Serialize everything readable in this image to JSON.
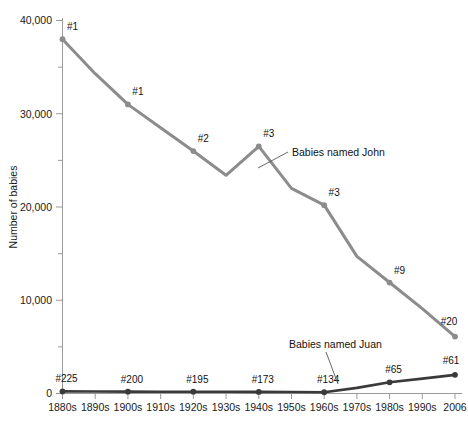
{
  "chart_data": {
    "type": "line",
    "title": "",
    "xlabel": "",
    "ylabel": "Number of babies",
    "ylim": [
      0,
      40000
    ],
    "ytick_labels": [
      "0",
      "10,000",
      "20,000",
      "30,000",
      "40,000"
    ],
    "ytick_values": [
      0,
      10000,
      20000,
      30000,
      40000
    ],
    "yminor_values": [
      5000,
      15000,
      25000,
      35000
    ],
    "grid": false,
    "legend_position": "inline-annotation",
    "categories": [
      "1880s",
      "1890s",
      "1900s",
      "1910s",
      "1920s",
      "1930s",
      "1940s",
      "1950s",
      "1960s",
      "1970s",
      "1980s",
      "1990s",
      "2006"
    ],
    "series": [
      {
        "name": "Babies named John",
        "color": "#8c8c8c",
        "values": [
          38000,
          34300,
          31000,
          28500,
          26000,
          23400,
          26500,
          22000,
          20200,
          14700,
          11900,
          9100,
          6100
        ],
        "point_labels": [
          {
            "category": "1880s",
            "text": "#1"
          },
          {
            "category": "1900s",
            "text": "#1"
          },
          {
            "category": "1920s",
            "text": "#2"
          },
          {
            "category": "1940s",
            "text": "#3"
          },
          {
            "category": "1960s",
            "text": "#3"
          },
          {
            "category": "1980s",
            "text": "#9"
          },
          {
            "category": "2006",
            "text": "#20"
          }
        ],
        "marker_categories": [
          "1880s",
          "1900s",
          "1920s",
          "1940s",
          "1960s",
          "1980s",
          "2006"
        ],
        "annotation": "Babies named John"
      },
      {
        "name": "Babies named Juan",
        "color": "#3a3a3a",
        "values": [
          225,
          210,
          200,
          195,
          195,
          180,
          173,
          160,
          134,
          600,
          1200,
          1600,
          2000
        ],
        "point_labels": [
          {
            "category": "1880s",
            "text": "#225"
          },
          {
            "category": "1900s",
            "text": "#200"
          },
          {
            "category": "1920s",
            "text": "#195"
          },
          {
            "category": "1940s",
            "text": "#173"
          },
          {
            "category": "1960s",
            "text": "#134"
          },
          {
            "category": "1980s",
            "text": "#65"
          },
          {
            "category": "2006",
            "text": "#61"
          }
        ],
        "marker_categories": [
          "1880s",
          "1900s",
          "1920s",
          "1940s",
          "1960s",
          "1980s",
          "2006"
        ],
        "annotation": "Babies named Juan"
      }
    ]
  },
  "annotations": {
    "john": "Babies named John",
    "juan": "Babies named Juan"
  },
  "axis": {
    "ylabel": "Number of babies"
  },
  "caption": ""
}
